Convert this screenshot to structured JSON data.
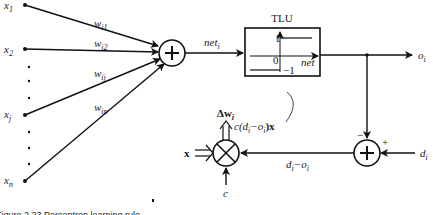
{
  "inputs": [
    {
      "label": "x",
      "sub": "1",
      "y": 5
    },
    {
      "label": "x",
      "sub": "2",
      "y": 49
    },
    {
      "label": "x",
      "sub": "j",
      "y": 115
    },
    {
      "label": "x",
      "sub": "n",
      "y": 181
    }
  ],
  "weights": [
    {
      "label": "w",
      "sub": "i1"
    },
    {
      "label": "w",
      "sub": "i2"
    },
    {
      "label": "w",
      "sub": "ij"
    },
    {
      "label": "w",
      "sub": "in"
    }
  ],
  "net_label": {
    "main": "net",
    "sub": "i"
  },
  "tlu": {
    "title": "TLU",
    "high": "1",
    "zero": "0",
    "low": "−1",
    "axis_label": "net"
  },
  "output": {
    "main": "o",
    "sub": "i"
  },
  "desired": {
    "main": "d",
    "sub": "i"
  },
  "error": {
    "text": "d",
    "sub1": "i",
    "minus": "−o",
    "sub2": "i"
  },
  "signs": {
    "minus": "−",
    "plus": "+"
  },
  "delta_w": {
    "prefix": "Δw",
    "sub": "i"
  },
  "update_expr": {
    "text": "c(d",
    "sub1": "i",
    "mid": "−o",
    "sub2": "i",
    "tail": ")x"
  },
  "vector_input": "x",
  "learning_rate": "c",
  "caption": "Figure 2.23   Perceptron learning rule"
}
